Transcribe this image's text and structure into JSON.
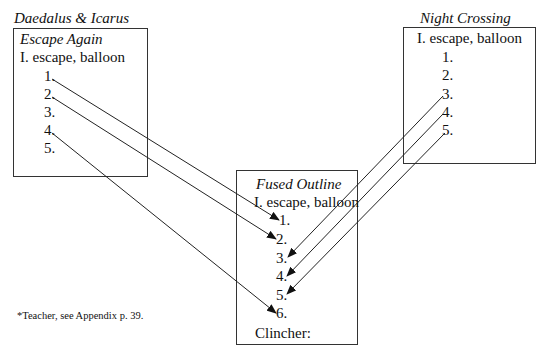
{
  "top_fragment": "(cropped text above)",
  "left": {
    "title": "Daedalus & Icarus",
    "subtitle": "Escape Again",
    "heading": "I. escape, balloon",
    "items": [
      "1.",
      "2.",
      "3.",
      "4.",
      "5."
    ]
  },
  "right": {
    "title": "Night Crossing",
    "heading": "I. escape, balloon",
    "items": [
      "1.",
      "2.",
      "3.",
      "4.",
      "5."
    ]
  },
  "fused": {
    "title": "Fused Outline",
    "heading": "I. escape, balloon",
    "items": [
      "1.",
      "2.",
      "3.",
      "4.",
      "5.",
      "6."
    ],
    "clincher": "Clincher:"
  },
  "footnote": "*Teacher, see Appendix p. 39.",
  "arrows": [
    {
      "from": "left.1",
      "to": "fused.1"
    },
    {
      "from": "left.2",
      "to": "fused.2"
    },
    {
      "from": "left.4",
      "to": "fused.6"
    },
    {
      "from": "right.3",
      "to": "fused.3"
    },
    {
      "from": "right.4",
      "to": "fused.4"
    },
    {
      "from": "right.5",
      "to": "fused.5"
    }
  ]
}
